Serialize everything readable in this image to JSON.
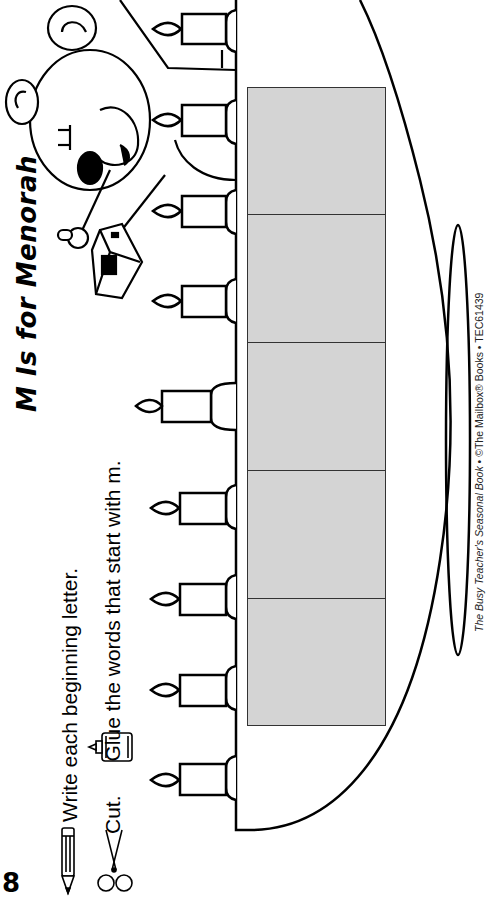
{
  "page": {
    "page_number": "8",
    "title_prefix": "M Is for ",
    "title_emphasis": "Menorah",
    "instructions": {
      "write": "Write each beginning letter.",
      "cut": "Cut.",
      "glue": "Glue the words that start with m."
    },
    "footer": {
      "book_title": "The Busy Teacher's Seasonal Book",
      "separator": " • ",
      "copyright": "©The Mailbox® Books",
      "code": "TEC61439"
    },
    "icons": [
      "pencil-icon",
      "scissors-icon",
      "glue-bottle-icon"
    ],
    "illustration": {
      "subject": "bear holding dreidel beside menorah",
      "candle_count": 9,
      "answer_boxes": 5
    },
    "colors": {
      "box_fill": "#d4d4d4",
      "line": "#000000",
      "background": "#ffffff"
    }
  }
}
